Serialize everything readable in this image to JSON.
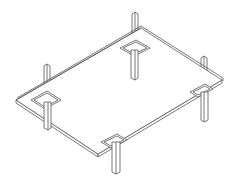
{
  "figure": {
    "colors": {
      "background": "#ffffff",
      "line": "#555555"
    },
    "parts": {
      "plate": "rectangular-plate",
      "posts_top_count": 3,
      "legs_bottom_count": 4,
      "pads_count": 4
    }
  }
}
